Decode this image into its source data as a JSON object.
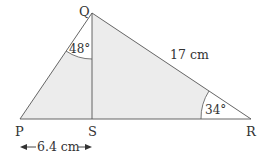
{
  "diagram": {
    "vertices": {
      "P": {
        "label": "P",
        "x": 20,
        "y": 119
      },
      "Q": {
        "label": "Q",
        "x": 92,
        "y": 13
      },
      "R": {
        "label": "R",
        "x": 251,
        "y": 119
      },
      "S": {
        "label": "S",
        "x": 92,
        "y": 119
      }
    },
    "angles": {
      "PQS": {
        "label": "48°"
      },
      "QRS": {
        "label": "34°"
      }
    },
    "lengths": {
      "QR": {
        "label": "17 cm"
      },
      "PS": {
        "label": "6.4 cm"
      }
    },
    "colors": {
      "fill": "#ececec",
      "stroke": "#555555",
      "arc_fill": "#ffffff"
    }
  }
}
